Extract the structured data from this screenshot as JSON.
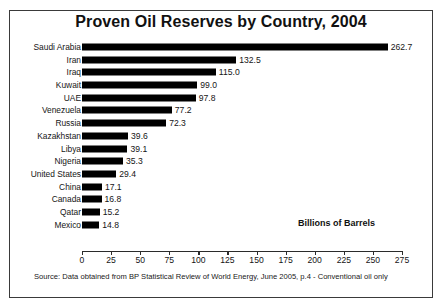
{
  "chart_data": {
    "type": "bar",
    "orientation": "horizontal",
    "title": "Proven Oil Reserves by Country, 2004",
    "xlabel": "Billions of Barrels",
    "ylabel": "",
    "xlim": [
      0,
      275
    ],
    "xticks": [
      0,
      25,
      50,
      75,
      100,
      125,
      150,
      175,
      200,
      225,
      250,
      275
    ],
    "grid": false,
    "legend": null,
    "bar_color": "#000000",
    "categories": [
      "Saudi Arabia",
      "Iran",
      "Iraq",
      "Kuwait",
      "UAE",
      "Venezuela",
      "Russia",
      "Kazakhstan",
      "Libya",
      "Nigeria",
      "United States",
      "China",
      "Canada",
      "Qatar",
      "Mexico"
    ],
    "values": [
      262.7,
      132.5,
      115.0,
      99.0,
      97.8,
      77.2,
      72.3,
      39.6,
      39.1,
      35.3,
      29.4,
      17.1,
      16.8,
      15.2,
      14.8
    ],
    "value_labels": [
      "262.7",
      "132.5",
      "115.0",
      "99.0",
      "97.8",
      "77.2",
      "72.3",
      "39.6",
      "39.1",
      "35.3",
      "29.4",
      "17.1",
      "16.8",
      "15.2",
      "14.8"
    ],
    "source_note": "Source: Data obtained from BP Statistical Review of World Energy, June 2005, p.4 - Conventional oil only"
  }
}
